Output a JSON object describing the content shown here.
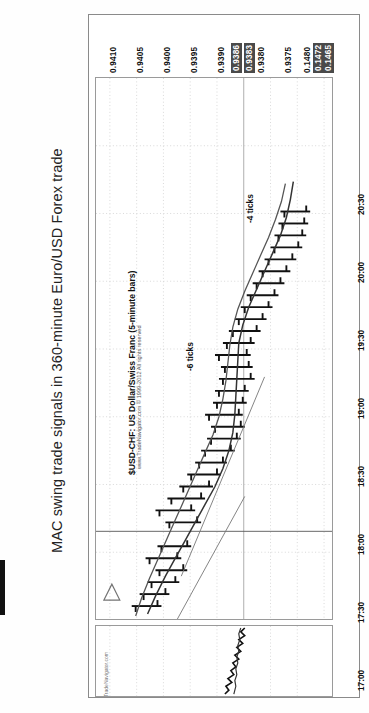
{
  "figure": {
    "title": "MAC swing trade signals in 360-minute Euro/USD Forex trade"
  },
  "chart_header": {
    "symbol_caption": "$USD-CHF: US Dollar/Swiss Franc (5-minute bars)",
    "copyright": "www.TradeNavigator.com © 1999-2012 All rights reserved",
    "watermark": "TradeNavigator.com"
  },
  "annotations": [
    {
      "name": "annot-minus-6-ticks",
      "text": "-6 ticks"
    },
    {
      "name": "annot-minus-4-ticks",
      "text": "-4 ticks"
    }
  ],
  "axes": {
    "price_labels": [
      {
        "text": "0.9410",
        "highlight": false
      },
      {
        "text": "0.9405",
        "highlight": false
      },
      {
        "text": "0.9400",
        "highlight": false
      },
      {
        "text": "0.9395",
        "highlight": false
      },
      {
        "text": "0.9390",
        "highlight": false
      },
      {
        "text": "0.9386",
        "highlight": true
      },
      {
        "text": "0.9383",
        "highlight": true
      },
      {
        "text": "0.9380",
        "highlight": false
      },
      {
        "text": "0.9375",
        "highlight": false
      },
      {
        "text": "0.1480",
        "highlight": false
      },
      {
        "text": "0.1472",
        "highlight": true
      },
      {
        "text": "0.1465",
        "highlight": true
      }
    ],
    "time_labels": [
      "17:00",
      "17:30",
      "18:00",
      "18:30",
      "19:00",
      "19:30",
      "20:00",
      "20:30"
    ]
  },
  "chart_data": {
    "type": "line",
    "title": "$USD-CHF: US Dollar/Swiss Franc (5-minute bars)",
    "xlabel": "Time",
    "ylabel": "Price",
    "grid": true,
    "legend": "none",
    "xlim": [
      "16:45",
      "20:45"
    ],
    "ylim": [
      0.9372,
      0.9412
    ],
    "x": [
      "17:00",
      "17:05",
      "17:10",
      "17:15",
      "17:20",
      "17:25",
      "17:30",
      "17:35",
      "17:40",
      "17:45",
      "17:50",
      "17:55",
      "18:00",
      "18:05",
      "18:10",
      "18:15",
      "18:20",
      "18:25",
      "18:30",
      "18:35",
      "18:40",
      "18:45",
      "18:50",
      "18:55",
      "19:00",
      "19:05",
      "19:10",
      "19:15",
      "19:20",
      "19:25",
      "19:30",
      "19:35",
      "19:40"
    ],
    "ohlc": [
      {
        "t": "17:00",
        "o": 0.9378,
        "h": 0.9381,
        "l": 0.9376,
        "c": 0.938
      },
      {
        "t": "17:05",
        "o": 0.938,
        "h": 0.9383,
        "l": 0.9378,
        "c": 0.9382
      },
      {
        "t": "17:10",
        "o": 0.9382,
        "h": 0.9385,
        "l": 0.938,
        "c": 0.9384
      },
      {
        "t": "17:15",
        "o": 0.9384,
        "h": 0.9387,
        "l": 0.9382,
        "c": 0.9386
      },
      {
        "t": "17:20",
        "o": 0.9386,
        "h": 0.9389,
        "l": 0.9384,
        "c": 0.9387
      },
      {
        "t": "17:25",
        "o": 0.9387,
        "h": 0.939,
        "l": 0.9385,
        "c": 0.9389
      },
      {
        "t": "17:30",
        "o": 0.9389,
        "h": 0.9392,
        "l": 0.9387,
        "c": 0.9391
      },
      {
        "t": "17:35",
        "o": 0.9391,
        "h": 0.9394,
        "l": 0.9389,
        "c": 0.9392
      },
      {
        "t": "17:40",
        "o": 0.9392,
        "h": 0.9396,
        "l": 0.939,
        "c": 0.9395
      },
      {
        "t": "17:45",
        "o": 0.9395,
        "h": 0.9398,
        "l": 0.9393,
        "c": 0.9396
      },
      {
        "t": "17:50",
        "o": 0.9396,
        "h": 0.9399,
        "l": 0.9394,
        "c": 0.9397
      },
      {
        "t": "17:55",
        "o": 0.9397,
        "h": 0.94,
        "l": 0.9395,
        "c": 0.9398
      },
      {
        "t": "18:00",
        "o": 0.9398,
        "h": 0.9401,
        "l": 0.9396,
        "c": 0.9399
      },
      {
        "t": "18:05",
        "o": 0.9399,
        "h": 0.9401,
        "l": 0.9396,
        "c": 0.9397
      },
      {
        "t": "18:10",
        "o": 0.9397,
        "h": 0.94,
        "l": 0.9395,
        "c": 0.9398
      },
      {
        "t": "18:15",
        "o": 0.9398,
        "h": 0.94,
        "l": 0.9396,
        "c": 0.9399
      },
      {
        "t": "18:20",
        "o": 0.9399,
        "h": 0.9402,
        "l": 0.9397,
        "c": 0.9401
      },
      {
        "t": "18:25",
        "o": 0.9401,
        "h": 0.9403,
        "l": 0.9399,
        "c": 0.94
      },
      {
        "t": "18:30",
        "o": 0.94,
        "h": 0.9402,
        "l": 0.9398,
        "c": 0.9399
      },
      {
        "t": "18:35",
        "o": 0.9399,
        "h": 0.9401,
        "l": 0.9397,
        "c": 0.9398
      },
      {
        "t": "18:40",
        "o": 0.9398,
        "h": 0.94,
        "l": 0.9396,
        "c": 0.9398
      },
      {
        "t": "18:45",
        "o": 0.9398,
        "h": 0.9401,
        "l": 0.9396,
        "c": 0.94
      },
      {
        "t": "18:50",
        "o": 0.94,
        "h": 0.9403,
        "l": 0.9398,
        "c": 0.9402
      },
      {
        "t": "18:55",
        "o": 0.9402,
        "h": 0.9405,
        "l": 0.94,
        "c": 0.9404
      },
      {
        "t": "19:00",
        "o": 0.9404,
        "h": 0.9406,
        "l": 0.9402,
        "c": 0.9405
      },
      {
        "t": "19:05",
        "o": 0.9405,
        "h": 0.9407,
        "l": 0.9403,
        "c": 0.9406
      },
      {
        "t": "19:10",
        "o": 0.9406,
        "h": 0.9408,
        "l": 0.9404,
        "c": 0.9407
      },
      {
        "t": "19:15",
        "o": 0.9407,
        "h": 0.9409,
        "l": 0.9405,
        "c": 0.9408
      },
      {
        "t": "19:20",
        "o": 0.9408,
        "h": 0.941,
        "l": 0.9406,
        "c": 0.9409
      },
      {
        "t": "19:25",
        "o": 0.9409,
        "h": 0.9411,
        "l": 0.9407,
        "c": 0.9409
      },
      {
        "t": "19:30",
        "o": 0.9409,
        "h": 0.9411,
        "l": 0.9407,
        "c": 0.941
      },
      {
        "t": "19:35",
        "o": 0.941,
        "h": 0.9412,
        "l": 0.9408,
        "c": 0.941
      },
      {
        "t": "19:40",
        "o": 0.941,
        "h": 0.9412,
        "l": 0.9408,
        "c": 0.9411
      }
    ],
    "series": [
      {
        "name": "Fast moving average",
        "values": [
          0.9379,
          0.9381,
          0.9383,
          0.9385,
          0.9386,
          0.9388,
          0.939,
          0.9391,
          0.9393,
          0.9395,
          0.9396,
          0.9397,
          0.9398,
          0.9398,
          0.9398,
          0.9398,
          0.9399,
          0.94,
          0.94,
          0.9399,
          0.9398,
          0.9399,
          0.94,
          0.9402,
          0.9404,
          0.9405,
          0.9406,
          0.9407,
          0.9408,
          0.9409,
          0.9409,
          0.941,
          0.941
        ]
      },
      {
        "name": "Slow moving average",
        "values": [
          0.9377,
          0.9378,
          0.9379,
          0.9381,
          0.9382,
          0.9384,
          0.9385,
          0.9387,
          0.9388,
          0.939,
          0.9391,
          0.9393,
          0.9394,
          0.9395,
          0.9396,
          0.9396,
          0.9397,
          0.9398,
          0.9398,
          0.9398,
          0.9398,
          0.9398,
          0.9399,
          0.94,
          0.9401,
          0.9402,
          0.9403,
          0.9404,
          0.9405,
          0.9406,
          0.9407,
          0.9408,
          0.9409
        ]
      }
    ],
    "indicator_pane": {
      "name": "MACD-style oscillator",
      "ylim": [
        0.1462,
        0.1484
      ],
      "series": [
        {
          "name": "MACD line",
          "values": [
            0.1468,
            0.1467,
            0.147,
            0.1466,
            0.1469,
            0.1467,
            0.1471,
            0.147,
            0.1472,
            0.1471,
            0.1473,
            0.1472,
            0.1474,
            0.1473,
            0.1475,
            0.1474,
            0.1476,
            0.1475,
            0.1477,
            0.1476,
            0.1476,
            0.1475,
            0.1477,
            0.1478,
            0.1477,
            0.1479,
            0.1478,
            0.148,
            0.1479,
            0.1478,
            0.1477,
            0.1476,
            0.1474
          ]
        },
        {
          "name": "Signal line",
          "values": [
            0.147,
            0.1469,
            0.1469,
            0.1469,
            0.147,
            0.147,
            0.1471,
            0.1471,
            0.1472,
            0.1472,
            0.1473,
            0.1473,
            0.1474,
            0.1474,
            0.1475,
            0.1475,
            0.1475,
            0.1476,
            0.1476,
            0.1476,
            0.1476,
            0.1476,
            0.1477,
            0.1477,
            0.1477,
            0.1478,
            0.1478,
            0.1479,
            0.1479,
            0.1479,
            0.1478,
            0.1477,
            0.1476
          ]
        }
      ]
    }
  }
}
